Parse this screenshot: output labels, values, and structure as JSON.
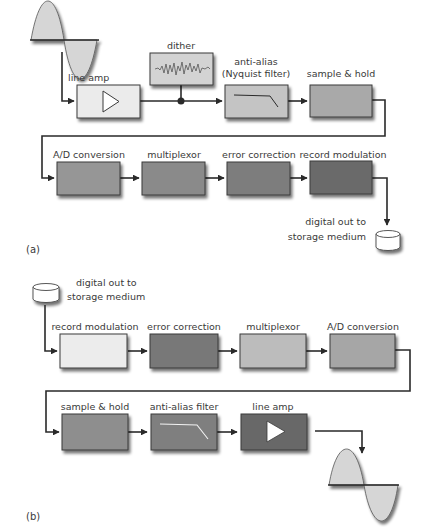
{
  "diagram": {
    "colors": {
      "line": "#2a2a2a",
      "box_border": "#3b3b3b",
      "sine_fill": "#d6d6d6",
      "cylinder_fill": "#ffffff",
      "text": "#3a3a3a"
    },
    "panel_a": {
      "label": "(a)",
      "input_icon": "sine-wave-icon",
      "blocks": [
        {
          "id": "line-amp",
          "label": "line amp",
          "icon": "amplifier-triangle-icon",
          "color": "#ebebeb"
        },
        {
          "id": "dither",
          "label": "dither",
          "icon": "noise-waveform-icon",
          "color": "#d3d3d3"
        },
        {
          "id": "anti-alias",
          "label_line1": "anti-alias",
          "label_line2": "(Nyquist filter)",
          "icon": "lowpass-curve-icon",
          "color": "#c4c4c4"
        },
        {
          "id": "sample-hold",
          "label": "sample & hold",
          "color": "#a9a9a9"
        },
        {
          "id": "ad-conversion",
          "label": "A/D conversion",
          "color": "#969696"
        },
        {
          "id": "multiplexor",
          "label": "multiplexor",
          "color": "#8a8a8a"
        },
        {
          "id": "error-correction",
          "label": "error correction",
          "color": "#7d7d7d"
        },
        {
          "id": "record-modulation",
          "label": "record modulation",
          "color": "#6a6a6a"
        }
      ],
      "output": {
        "icon": "storage-cylinder-icon",
        "label_line1": "digital out to",
        "label_line2": "storage medium"
      }
    },
    "panel_b": {
      "label": "(b)",
      "input": {
        "icon": "storage-cylinder-icon",
        "label_line1": "digital out to",
        "label_line2": "storage medium"
      },
      "blocks": [
        {
          "id": "record-modulation",
          "label": "record modulation",
          "color": "#ececec"
        },
        {
          "id": "error-correction",
          "label": "error correction",
          "color": "#787878"
        },
        {
          "id": "multiplexor",
          "label": "multiplexor",
          "color": "#bcbcbc"
        },
        {
          "id": "ad-conversion",
          "label": "A/D conversion",
          "color": "#a6a6a6"
        },
        {
          "id": "sample-hold",
          "label": "sample & hold",
          "color": "#8e8e8e"
        },
        {
          "id": "anti-alias",
          "label": "anti-alias filter",
          "icon": "lowpass-curve-icon",
          "color": "#7f7f7f"
        },
        {
          "id": "line-amp",
          "label": "line amp",
          "icon": "amplifier-triangle-icon",
          "color": "#686868"
        }
      ],
      "output_icon": "sine-wave-icon"
    }
  }
}
